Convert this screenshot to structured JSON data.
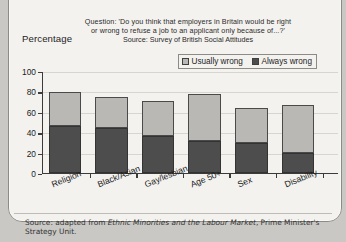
{
  "header": {
    "question_line1": "Question: 'Do you think that employers in Britain would be right",
    "question_line2": "or wrong to refuse a job to an applicant only because of...?'",
    "source": "Source: Survey of British Social Attitudes",
    "axis_title": "Percentage"
  },
  "legend": {
    "items": [
      {
        "label": "Usually wrong",
        "color": "#b9b8b4"
      },
      {
        "label": "Always wrong",
        "color": "#4d4d4d"
      }
    ]
  },
  "footer": {
    "prefix": "Source: adapted from ",
    "italic": "Ethnic Minorities and the Labour Market",
    "suffix": ", Prime Minister's Strategy Unit."
  },
  "chart_data": {
    "type": "bar",
    "subtype": "stacked",
    "title": "Question: 'Do you think that employers in Britain would be right or wrong to refuse a job to an applicant only because of...?'",
    "xlabel": "",
    "ylabel": "Percentage",
    "ylim": [
      0,
      100
    ],
    "yticks": [
      0,
      20,
      40,
      60,
      80,
      100
    ],
    "grid": true,
    "legend_position": "top-right",
    "categories": [
      "Religion",
      "Black/Asian",
      "Gay/lesbian",
      "Age 50+",
      "Sex",
      "Disability"
    ],
    "series": [
      {
        "name": "Always wrong",
        "color": "#4d4d4d",
        "values": [
          46,
          44,
          36,
          31,
          29,
          20
        ]
      },
      {
        "name": "Usually wrong",
        "color": "#b9b8b4",
        "values": [
          33,
          31,
          35,
          46,
          35,
          47
        ]
      }
    ],
    "totals": [
      79,
      75,
      71,
      77,
      64,
      67
    ]
  }
}
